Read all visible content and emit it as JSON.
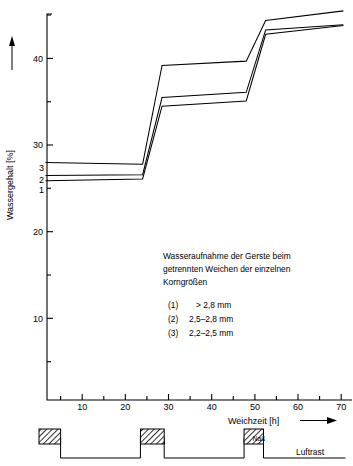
{
  "chart_data": {
    "type": "line",
    "title": "",
    "annotation": {
      "lines": [
        "Wasseraufnahme der Gerste beim",
        "getrennten Weichen der einzelnen",
        "Korngrößen"
      ],
      "legend": [
        {
          "key": "(1)",
          "value": "> 2,8 mm"
        },
        {
          "key": "(2)",
          "value": "2,5–2,8 mm"
        },
        {
          "key": "(3)",
          "value": "2,2–2,5 mm"
        }
      ]
    },
    "xlabel": "Weichzeit [h]",
    "ylabel": "Wassergehalt [%]",
    "xlim": [
      0,
      71
    ],
    "ylim": [
      0,
      45.5
    ],
    "xticks_major": [
      10,
      20,
      30,
      40,
      50,
      60,
      70
    ],
    "xticks_minor": [
      5,
      15,
      25,
      35,
      45,
      55,
      65
    ],
    "yticks_major": [
      10,
      20,
      30,
      40
    ],
    "yticks_minor": [
      5,
      15,
      25,
      35,
      45
    ],
    "grid": false,
    "legend_position": "inline-left-of-curves",
    "series": [
      {
        "name": "1",
        "label": "> 2,8 mm",
        "points": [
          {
            "x": 1.5,
            "y": 25.3
          },
          {
            "x": 24.0,
            "y": 25.5
          },
          {
            "x": 28.5,
            "y": 33.9
          },
          {
            "x": 48.0,
            "y": 34.5
          },
          {
            "x": 52.5,
            "y": 42.2
          },
          {
            "x": 70.5,
            "y": 43.2
          }
        ]
      },
      {
        "name": "2",
        "label": "2,5–2,8 mm",
        "points": [
          {
            "x": 1.5,
            "y": 25.9
          },
          {
            "x": 24.0,
            "y": 26.0
          },
          {
            "x": 28.5,
            "y": 34.9
          },
          {
            "x": 48.0,
            "y": 35.5
          },
          {
            "x": 52.5,
            "y": 42.7
          },
          {
            "x": 70.5,
            "y": 43.3
          }
        ]
      },
      {
        "name": "3",
        "label": "2,2–2,5 mm",
        "points": [
          {
            "x": 1.5,
            "y": 27.4
          },
          {
            "x": 24.0,
            "y": 27.2
          },
          {
            "x": 28.5,
            "y": 38.6
          },
          {
            "x": 48.0,
            "y": 39.1
          },
          {
            "x": 52.5,
            "y": 43.8
          },
          {
            "x": 70.5,
            "y": 44.9
          }
        ]
      }
    ]
  },
  "process_diagram": {
    "name": "Weichprogramm",
    "wet_label": "Naß",
    "air_rest_label": "Luftrast",
    "segments": [
      {
        "kind": "wet",
        "x_start": 0.0,
        "x_end": 5.0
      },
      {
        "kind": "air",
        "x_start": 5.0,
        "x_end": 23.5
      },
      {
        "kind": "wet",
        "x_start": 23.5,
        "x_end": 29.0
      },
      {
        "kind": "air",
        "x_start": 29.0,
        "x_end": 47.5
      },
      {
        "kind": "wet",
        "x_start": 47.5,
        "x_end": 52.0
      },
      {
        "kind": "air",
        "x_start": 52.0,
        "x_end": 71.0
      }
    ]
  },
  "axes": {
    "x_arrow": true,
    "y_arrow": true
  }
}
